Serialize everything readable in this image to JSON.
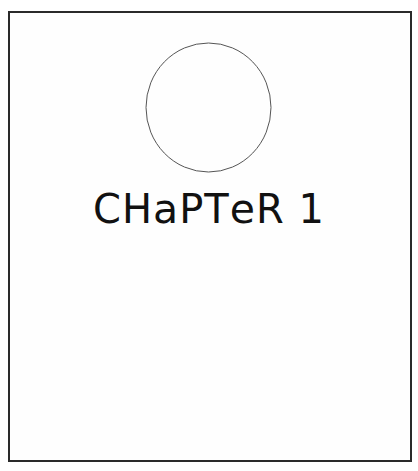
{
  "page": {
    "border_color": "#2a2a2a",
    "background": "#fefefe"
  },
  "emblem": {
    "shape": "circle-outline",
    "stroke": "#555555"
  },
  "title": {
    "text": "CHAPTER 1",
    "parts": [
      "CH",
      "a",
      "PT",
      "e",
      "R",
      " 1"
    ]
  }
}
